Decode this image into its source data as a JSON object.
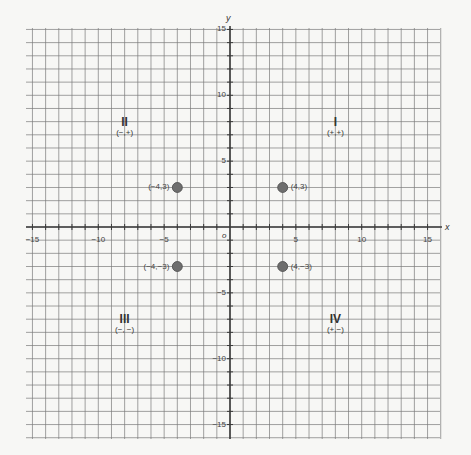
{
  "figure": {
    "x_axis_label": "x",
    "y_axis_label": "y",
    "origin_label": "o"
  },
  "x_ticks": [
    {
      "value": -15,
      "label": "−15"
    },
    {
      "value": -10,
      "label": "−10"
    },
    {
      "value": -5,
      "label": "−5"
    },
    {
      "value": 5,
      "label": "5"
    },
    {
      "value": 10,
      "label": "10"
    },
    {
      "value": 15,
      "label": "15"
    }
  ],
  "y_ticks": [
    {
      "value": 15,
      "label": "15"
    },
    {
      "value": 10,
      "label": "10"
    },
    {
      "value": 5,
      "label": "5"
    },
    {
      "value": -5,
      "label": "−5"
    },
    {
      "value": -10,
      "label": "−10"
    },
    {
      "value": -15,
      "label": "−15"
    }
  ],
  "points": [
    {
      "x": -4,
      "y": 3,
      "label": "(−4,3)",
      "label_side": "left"
    },
    {
      "x": 4,
      "y": 3,
      "label": "(4,3)",
      "label_side": "right"
    },
    {
      "x": -4,
      "y": -3,
      "label": "(−4,−3)",
      "label_side": "left"
    },
    {
      "x": 4,
      "y": -3,
      "label": "(4,−3)",
      "label_side": "right"
    }
  ],
  "quadrants": [
    {
      "numeral": "II",
      "signs": "(−,+)",
      "x": -8,
      "y": 8.1
    },
    {
      "numeral": "I",
      "signs": "(+,+)",
      "x": 8,
      "y": 8.1
    },
    {
      "numeral": "III",
      "signs": "(−, −)",
      "x": -8,
      "y": -6.8
    },
    {
      "numeral": "IV",
      "signs": "(+,−)",
      "x": 8,
      "y": -6.8
    }
  ],
  "colors": {
    "grid": "#7a7a7a",
    "axis": "#3a3a3a",
    "point_fill": "#6e6e6e",
    "point_stroke": "#4a4a4a"
  },
  "chart_data": {
    "type": "scatter",
    "title": "",
    "xlabel": "x",
    "ylabel": "y",
    "xlim": [
      -15,
      15
    ],
    "ylim": [
      -15,
      15
    ],
    "grid": true,
    "grid_step": 1,
    "series": [
      {
        "name": "points",
        "x": [
          -4,
          4,
          -4,
          4
        ],
        "y": [
          3,
          3,
          -3,
          -3
        ],
        "labels": [
          "(-4,3)",
          "(4,3)",
          "(-4,-3)",
          "(4,-3)"
        ]
      }
    ],
    "annotations": [
      {
        "text": "II (-,+)",
        "x": -8,
        "y": 8
      },
      {
        "text": "I (+,+)",
        "x": 8,
        "y": 8
      },
      {
        "text": "III (-,-)",
        "x": -8,
        "y": -7
      },
      {
        "text": "IV (+,-)",
        "x": 8,
        "y": -7
      }
    ]
  }
}
